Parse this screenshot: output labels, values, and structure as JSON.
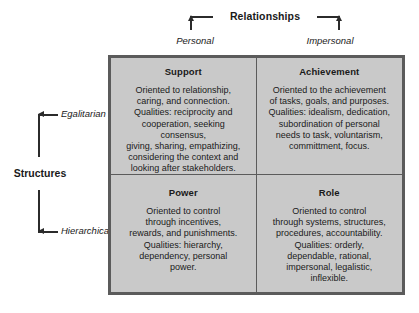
{
  "diagram": {
    "horizontal_axis": {
      "title": "Relationships",
      "left_label": "Personal",
      "right_label": "Impersonal"
    },
    "vertical_axis": {
      "title": "Structures",
      "top_label": "Egalitarian",
      "bottom_label": "Hierarchical"
    },
    "quadrants": {
      "top_left": {
        "title": "Support",
        "body": "Oriented to relationship,\ncaring, and connection.\nQualities: reciprocity and\ncooperation, seeking consensus,\ngiving, sharing, empathizing,\nconsidering the context and\nlooking after stakeholders."
      },
      "top_right": {
        "title": "Achievement",
        "body": "Oriented to the achievement\nof tasks, goals, and purposes.\nQualities: idealism, dedication,\nsubordination of personal\nneeds to task, voluntarism,\ncommittment, focus."
      },
      "bottom_left": {
        "title": "Power",
        "body": "Oriented to control\nthrough incentives,\nrewards, and punishments.\nQualities: hierarchy,\ndependency, personal\npower."
      },
      "bottom_right": {
        "title": "Role",
        "body": "Oriented to control\nthrough systems, structures,\nprocedures, accountability.\nQualities: orderly,\ndependable, rational,\nimpersonal, legalistic,\ninflexible."
      }
    },
    "colors": {
      "cell_fill": "#c9c9c9",
      "border": "#5b5b5b",
      "axis_line": "#2b2b2b",
      "page_background": "#ffffff",
      "text": "#1a1a1a"
    }
  }
}
